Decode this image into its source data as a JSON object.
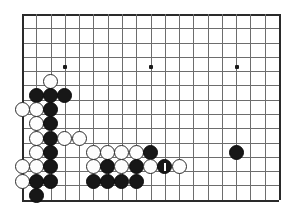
{
  "app": {
    "title": "Go Board Diagram",
    "board_type": "go-board",
    "view": "partial board, lower-left corner and lower side"
  },
  "board": {
    "grid_columns": 19,
    "grid_rows": 14,
    "line_color": "#6d6d6d",
    "edge_color": "#2a2a2a",
    "background_color": "#ffffff",
    "black_stone_color": "#171717",
    "white_stone_color": "#fdfdfd",
    "stone_diameter": 15,
    "cell_size": 14.28,
    "origin_x": 22,
    "origin_y": 14,
    "edges": {
      "left": true,
      "bottom": true,
      "right": true,
      "top": true
    },
    "star_points": [
      {
        "col": 3,
        "row": 3.7
      },
      {
        "col": 9,
        "row": 3.7
      },
      {
        "col": 15,
        "row": 3.7
      }
    ]
  },
  "stones": [
    {
      "id": "w-c2-r4_7",
      "color": "white",
      "col": 2,
      "row": 4.7,
      "label": ""
    },
    {
      "id": "b-c1-r5_7",
      "color": "black",
      "col": 1,
      "row": 5.7,
      "label": ""
    },
    {
      "id": "b-c2-r5_7",
      "color": "black",
      "col": 2,
      "row": 5.7,
      "label": ""
    },
    {
      "id": "b-c3-r5_7",
      "color": "black",
      "col": 3,
      "row": 5.7,
      "label": ""
    },
    {
      "id": "w-c0-r6_7",
      "color": "white",
      "col": 0,
      "row": 6.7,
      "label": ""
    },
    {
      "id": "w-c1-r6_7",
      "color": "white",
      "col": 1,
      "row": 6.7,
      "label": ""
    },
    {
      "id": "b-c2-r6_7",
      "color": "black",
      "col": 2,
      "row": 6.7,
      "label": ""
    },
    {
      "id": "w-c1-r7_7",
      "color": "white",
      "col": 1,
      "row": 7.7,
      "label": ""
    },
    {
      "id": "b-c2-r7_7",
      "color": "black",
      "col": 2,
      "row": 7.7,
      "label": ""
    },
    {
      "id": "w-c1-r8_7",
      "color": "white",
      "col": 1,
      "row": 8.7,
      "label": ""
    },
    {
      "id": "b-c2-r8_7",
      "color": "black",
      "col": 2,
      "row": 8.7,
      "label": ""
    },
    {
      "id": "w-c3-r8_7",
      "color": "white",
      "col": 3,
      "row": 8.7,
      "label": ""
    },
    {
      "id": "w-c4-r8_7",
      "color": "white",
      "col": 4,
      "row": 8.7,
      "label": ""
    },
    {
      "id": "w-c1-r9_7",
      "color": "white",
      "col": 1,
      "row": 9.7,
      "label": ""
    },
    {
      "id": "b-c2-r9_7",
      "color": "black",
      "col": 2,
      "row": 9.7,
      "label": ""
    },
    {
      "id": "w-c5-r9_7",
      "color": "white",
      "col": 5,
      "row": 9.7,
      "label": ""
    },
    {
      "id": "w-c6-r9_7",
      "color": "white",
      "col": 6,
      "row": 9.7,
      "label": ""
    },
    {
      "id": "w-c7-r9_7",
      "color": "white",
      "col": 7,
      "row": 9.7,
      "label": ""
    },
    {
      "id": "w-c8-r9_7",
      "color": "white",
      "col": 8,
      "row": 9.7,
      "label": ""
    },
    {
      "id": "b-c9-r9_7",
      "color": "black",
      "col": 9,
      "row": 9.7,
      "label": ""
    },
    {
      "id": "w-c0-r10_7",
      "color": "white",
      "col": 0,
      "row": 10.7,
      "label": ""
    },
    {
      "id": "w-c1-r10_7",
      "color": "white",
      "col": 1,
      "row": 10.7,
      "label": ""
    },
    {
      "id": "b-c2-r10_7",
      "color": "black",
      "col": 2,
      "row": 10.7,
      "label": ""
    },
    {
      "id": "w-c5-r10_7",
      "color": "white",
      "col": 5,
      "row": 10.7,
      "label": ""
    },
    {
      "id": "b-c6-r10_7",
      "color": "black",
      "col": 6,
      "row": 10.7,
      "label": ""
    },
    {
      "id": "w-c7-r10_7",
      "color": "white",
      "col": 7,
      "row": 10.7,
      "label": ""
    },
    {
      "id": "b-c8-r10_7",
      "color": "black",
      "col": 8,
      "row": 10.7,
      "label": ""
    },
    {
      "id": "w-c9-r10_7",
      "color": "white",
      "col": 9,
      "row": 10.7,
      "label": ""
    },
    {
      "id": "b-c10-r10_7",
      "color": "black",
      "col": 10,
      "row": 10.7,
      "label": "1",
      "marked": true
    },
    {
      "id": "w-c11-r10_7",
      "color": "white",
      "col": 11,
      "row": 10.7,
      "label": ""
    },
    {
      "id": "b-c15-r9_7",
      "color": "black",
      "col": 15,
      "row": 9.7,
      "label": ""
    },
    {
      "id": "w-c0-r11_7",
      "color": "white",
      "col": 0,
      "row": 11.7,
      "label": ""
    },
    {
      "id": "b-c1-r11_7",
      "color": "black",
      "col": 1,
      "row": 11.7,
      "label": ""
    },
    {
      "id": "b-c2-r11_7",
      "color": "black",
      "col": 2,
      "row": 11.7,
      "label": ""
    },
    {
      "id": "b-c5-r11_7",
      "color": "black",
      "col": 5,
      "row": 11.7,
      "label": ""
    },
    {
      "id": "b-c6-r11_7",
      "color": "black",
      "col": 6,
      "row": 11.7,
      "label": ""
    },
    {
      "id": "b-c7-r11_7",
      "color": "black",
      "col": 7,
      "row": 11.7,
      "label": ""
    },
    {
      "id": "b-c8-r11_7",
      "color": "black",
      "col": 8,
      "row": 11.7,
      "label": ""
    },
    {
      "id": "b-c1-r12_7",
      "color": "black",
      "col": 1,
      "row": 12.7,
      "label": ""
    }
  ],
  "marker": {
    "type": "move-number-bar",
    "color": "#ffffff",
    "move_number": "1"
  }
}
